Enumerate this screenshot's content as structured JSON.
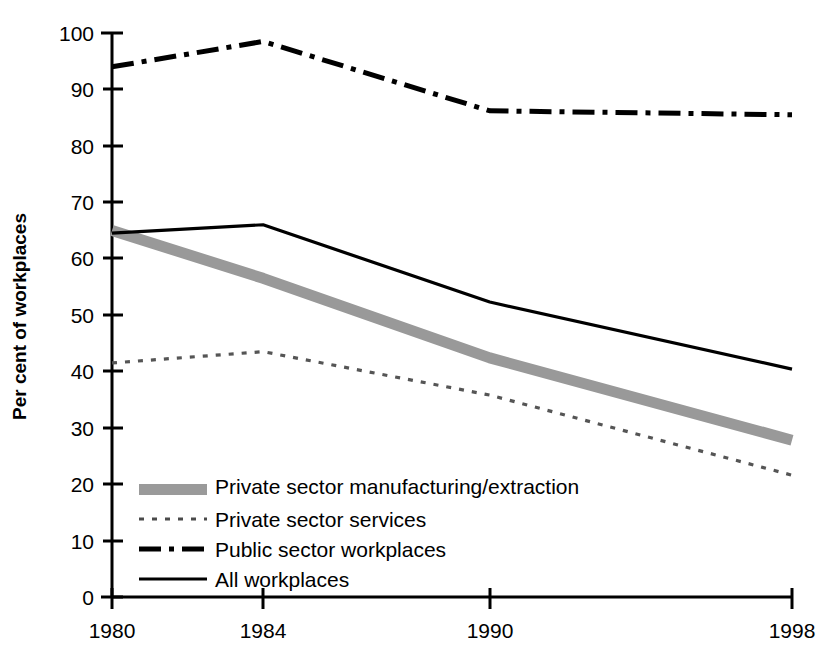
{
  "chart_data": {
    "type": "line",
    "title": "",
    "xlabel": "",
    "ylabel": "Per cent of workplaces",
    "x": [
      1980,
      1984,
      1990,
      1998
    ],
    "xtick_labels": [
      "1980",
      "1984",
      "1990",
      "1998"
    ],
    "xlim": [
      1980,
      1998
    ],
    "ylim": [
      0,
      100
    ],
    "ytick_labels": [
      "0",
      "10",
      "20",
      "30",
      "40",
      "50",
      "60",
      "70",
      "80",
      "90",
      "100"
    ],
    "ytick_values": [
      0,
      10,
      20,
      30,
      40,
      50,
      60,
      70,
      80,
      90,
      100
    ],
    "grid": false,
    "legend_position": "lower-left-inside",
    "series": [
      {
        "name": "Private sector manufacturing/extraction",
        "style": "thick-grey-band",
        "color": "#999999",
        "values": [
          65.0,
          56.5,
          42.4,
          27.8
        ]
      },
      {
        "name": "Private sector services",
        "style": "dotted",
        "color": "#555555",
        "values": [
          41.5,
          43.5,
          35.8,
          21.6
        ]
      },
      {
        "name": "Public sector workplaces",
        "style": "dash-dot",
        "color": "#000000",
        "values": [
          94.0,
          98.5,
          86.2,
          85.5
        ]
      },
      {
        "name": "All workplaces",
        "style": "solid",
        "color": "#000000",
        "values": [
          64.5,
          66.0,
          52.3,
          40.4
        ]
      }
    ]
  },
  "axis": {
    "y_title": "Per cent of workplaces",
    "y_ticks": [
      "100",
      "90",
      "80",
      "70",
      "60",
      "50",
      "40",
      "30",
      "20",
      "10",
      "0"
    ],
    "x_ticks": [
      "1980",
      "1984",
      "1990",
      "1998"
    ]
  },
  "legend": {
    "items": [
      {
        "label": "Private sector manufacturing/extraction",
        "style": "thick-grey-band"
      },
      {
        "label": "Private sector services",
        "style": "dotted"
      },
      {
        "label": "Public sector workplaces",
        "style": "dash-dot"
      },
      {
        "label": "All workplaces",
        "style": "solid"
      }
    ]
  }
}
